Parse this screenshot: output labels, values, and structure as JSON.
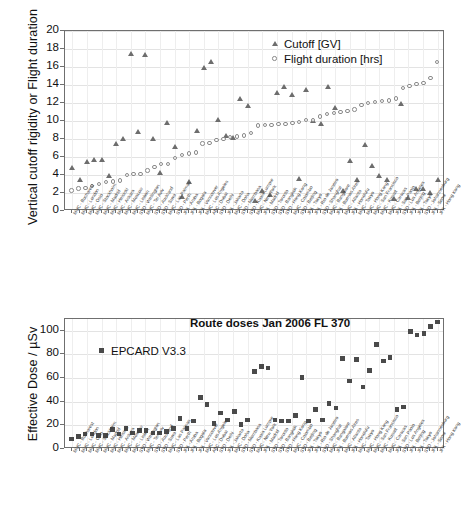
{
  "chart_data": [
    {
      "type": "scatter",
      "id": "top",
      "title": "",
      "ylabel": "Vertical cutoff rigidity or Flight duration",
      "xlabel": "",
      "ylim": [
        0,
        20
      ],
      "yticks": [
        0,
        2,
        4,
        6,
        8,
        10,
        12,
        14,
        16,
        18,
        20
      ],
      "grid": true,
      "legend_position": "top-right",
      "legend": [
        "Cutoff [GV]",
        "Flight duration [hrs]"
      ],
      "categories": [
        "MUC - Bucharest",
        "MUC - London",
        "MUC - Oslo",
        "MUC - Stockholm",
        "MUC - Madrid",
        "MUC - Helsinki",
        "MUC - Ankara",
        "MUC - Moscow",
        "MUC - Lisbon",
        "SYD - Wellington",
        "MUC - Tel Aviv",
        "SYD - Auckland",
        "SYD - Suva",
        "MUC - Las Palmas",
        "SYD - Perth",
        "JFK - Aruba",
        "JFK - Bogota",
        "JFK - Vancouver",
        "MUC - Los Angeles",
        "ABC - Dubai",
        "SYD - Delhi",
        "JFK - Jakarta",
        "MUC - Doha",
        "SYD - Mombasa",
        "SYD - Kuala Lumpur",
        "MUC - New York",
        "JFK - Madrid",
        "SYD - Toronto",
        "SYD - Bangkok",
        "SYD - Hong Kong",
        "MUC - Colombo",
        "SYD - Beijing",
        "JFK - Tokyo",
        "JFK - Rio de Janeiro",
        "SYD - Shanghai",
        "MUC - Bangalore",
        "JFK - Buenos Aires",
        "MUC - Atlanta",
        "JFK - Honolulu",
        "MUC - Tokyo",
        "MUC - Hong Kong",
        "MUC - San Francisco",
        "MUC - Kuwait",
        "MUC - Caracas",
        "JFK - San Paolo",
        "SYD - Los Angeles",
        "JFK - Beijing",
        "JFK - Tokyo",
        "SYD - Johannesburg",
        "JFK - Seoul",
        "JFK - Hong Kong"
      ],
      "series": [
        {
          "name": "Cutoff [GV]",
          "marker": "triangle",
          "values": [
            4.8,
            3.5,
            5.5,
            5.7,
            5.7,
            3.9,
            7.5,
            8.0,
            17.4,
            8.8,
            17.3,
            8.0,
            4.2,
            9.8,
            7.1,
            1.6,
            3.2,
            8.9,
            15.9,
            16.6,
            10.1,
            8.3,
            8.1,
            12.4,
            11.7,
            1.1,
            2.2,
            1.8,
            13.1,
            13.8,
            12.9,
            3.6,
            13.4,
            10.0,
            9.7,
            13.8,
            11.4,
            2.2,
            5.6,
            3.4,
            7.3,
            5.0,
            3.9,
            3.4,
            1.3,
            11.9,
            1.5,
            2.4,
            2.5,
            2.0,
            3.4
          ]
        },
        {
          "name": "Flight duration [hrs]",
          "marker": "circle",
          "values": [
            2.2,
            2.4,
            2.5,
            2.7,
            2.9,
            3.1,
            3.2,
            3.3,
            3.9,
            4.0,
            4.0,
            4.4,
            4.8,
            5.1,
            5.1,
            5.8,
            6.1,
            6.3,
            6.4,
            7.4,
            7.5,
            7.8,
            7.9,
            8.1,
            8.2,
            8.3,
            8.6,
            9.4,
            9.5,
            9.5,
            9.6,
            9.6,
            9.7,
            9.8,
            10.0,
            10.0,
            10.4,
            10.7,
            10.8,
            10.9,
            11.0,
            11.2,
            11.7,
            11.9,
            12.0,
            12.1,
            12.2,
            12.4,
            13.6,
            13.8,
            14.0,
            14.1,
            14.7,
            16.5
          ]
        }
      ]
    },
    {
      "type": "scatter",
      "id": "bottom",
      "title": "Route doses Jan 2006 FL 370",
      "ylabel": "Effective Dose / µSv",
      "xlabel": "",
      "ylim": [
        0,
        110
      ],
      "yticks": [
        0,
        20,
        40,
        60,
        80,
        100
      ],
      "grid": true,
      "legend_position": "upper-left",
      "legend": [
        "EPCARD V3.3"
      ],
      "categories": [
        "MUC - Bucharest",
        "MUC - London",
        "MUC - Oslo",
        "MUC - Stockholm",
        "MUC - Madrid",
        "MUC - Helsinki",
        "MUC - Ankara",
        "MUC - Moscow",
        "MUC - Lisbon",
        "SYD - Wellington",
        "MUC - Tel Aviv",
        "SYD - Auckland",
        "SYD - Suva",
        "MUC - Las Palmas",
        "SYD - Perth",
        "JFK - Aruba",
        "JFK - Bogota",
        "JFK - Vancouver",
        "MUC - Los Angeles",
        "ABC - Dubai",
        "SYD - Delhi",
        "JFK - Jakarta",
        "MUC - Doha",
        "SYD - Mombasa",
        "SYD - Kuala Lumpur",
        "MUC - New York",
        "JFK - Madrid",
        "SYD - Toronto",
        "SYD - Bangkok",
        "SYD - Hong Kong",
        "MUC - Colombo",
        "SYD - Beijing",
        "JFK - Tokyo",
        "JFK - Rio de Janeiro",
        "SYD - Shanghai",
        "MUC - Bangalore",
        "JFK - Buenos Aires",
        "MUC - Atlanta",
        "JFK - Honolulu",
        "MUC - Tokyo",
        "MUC - Hong Kong",
        "MUC - San Francisco",
        "MUC - Kuwait",
        "MUC - Caracas",
        "JFK - San Paolo",
        "SYD - Los Angeles",
        "JFK - Beijing",
        "JFK - Tokyo",
        "SYD - Johannesburg",
        "JFK - Seoul",
        "JFK - Hong Kong"
      ],
      "series": [
        {
          "name": "EPCARD V3.3",
          "marker": "square",
          "values": [
            8,
            10,
            12,
            12,
            11,
            11,
            16,
            12,
            17,
            13,
            15,
            15,
            13,
            13,
            14,
            17,
            25,
            17,
            23,
            43,
            37,
            21,
            30,
            24,
            31,
            20,
            24,
            65,
            69,
            68,
            24,
            23,
            23,
            28,
            60,
            23,
            33,
            24,
            38,
            34,
            76,
            57,
            75,
            52,
            66,
            88,
            74,
            77,
            33,
            35,
            99,
            96,
            97,
            103,
            107
          ]
        }
      ]
    }
  ],
  "figures": {
    "top": {
      "ylabel": "Vertical cutoff rigidity or Flight duration",
      "legend": [
        {
          "label": "Cutoff [GV]",
          "marker": "triangle"
        },
        {
          "label": "Flight duration [hrs]",
          "marker": "circle"
        }
      ]
    },
    "bottom": {
      "title": "Route doses Jan 2006 FL 370",
      "ylabel": "Effective Dose / µSv",
      "legend": [
        {
          "label": "EPCARD V3.3",
          "marker": "square"
        }
      ]
    }
  }
}
